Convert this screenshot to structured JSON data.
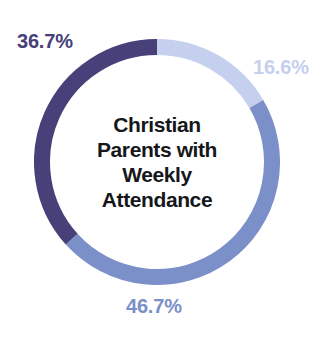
{
  "chart_data": {
    "type": "pie",
    "variant": "donut",
    "title": "Christian Parents with Weekly Attendance",
    "title_lines": [
      "Christian",
      "Parents with",
      "Weekly",
      "Attendance"
    ],
    "categories": [
      "Segment 1",
      "Segment 2",
      "Segment 3"
    ],
    "values": [
      16.6,
      46.7,
      36.7
    ],
    "labels": [
      "16.6%",
      "46.7%",
      "36.7%"
    ],
    "colors": [
      "#c5d0ef",
      "#7b8fc9",
      "#474079"
    ],
    "start_angle_deg": 0,
    "direction": "clockwise",
    "hole_ratio": 0.87,
    "legend": "none",
    "grid": false,
    "xlabel": "",
    "ylabel": ""
  },
  "chart": {
    "center_title": {
      "line1": "Christian",
      "line2": "Parents with",
      "line3": "Weekly",
      "line4": "Attendance"
    },
    "slices": [
      {
        "label": "16.6%",
        "value": 16.6,
        "color": "#c5d0ef",
        "label_color": "#c5d0ef",
        "position": "right"
      },
      {
        "label": "46.7%",
        "value": 46.7,
        "color": "#7b8fc9",
        "label_color": "#7b8fc9",
        "position": "bottom"
      },
      {
        "label": "36.7%",
        "value": 36.7,
        "color": "#474079",
        "label_color": "#474079",
        "position": "top-left"
      }
    ],
    "background_color": "#ffffff",
    "title_color": "#15171a"
  }
}
